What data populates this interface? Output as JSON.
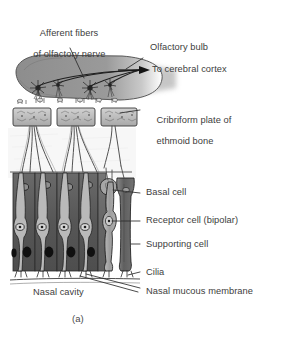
{
  "figure": {
    "domain": "anatomy-illustration",
    "caption": "(a)",
    "background_color": "#ffffff",
    "ink_color": "#3d3d3d"
  },
  "labels": {
    "afferent_fibers_line1": "Afferent fibers",
    "afferent_fibers_line2": "of olfactory nerve",
    "olfactory_bulb": "Olfactory bulb",
    "to_cerebral_cortex": "To cerebral cortex",
    "cribriform_line1": "Cribriform plate of",
    "cribriform_line2": "ethmoid bone",
    "basal_cell": "Basal cell",
    "receptor_cell": "Receptor cell (bipolar)",
    "supporting_cell": "Supporting cell",
    "cilia": "Cilia",
    "nasal_mucous_membrane": "Nasal mucous membrane",
    "nasal_cavity": "Nasal cavity"
  },
  "structures": {
    "olfactory_bulb": {
      "name": "olfactory-bulb",
      "fill": "#8e8e8e",
      "mitral_cells": 4
    },
    "cribriform_plate": {
      "name": "cribriform-plate",
      "blocks": 3,
      "fill": "#bdbdbd"
    },
    "epithelium": {
      "name": "olfactory-epithelium",
      "supporting_cells": 5,
      "fill": "#5d5d5d",
      "nucleus_fill": "#1a1a1a"
    },
    "isolated_cells": {
      "basal_cell_fill": "#9a9a9a",
      "receptor_cell_fill": "#a8a8a8",
      "supporting_cell_fill": "#6a6a6a"
    }
  }
}
